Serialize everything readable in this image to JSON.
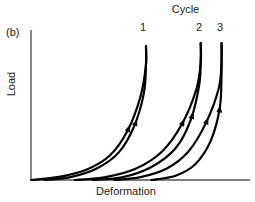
{
  "figure": {
    "panel_label": "(b)",
    "legend_title": "Cycle",
    "cycle_labels": [
      "1",
      "2",
      "3"
    ],
    "ink_color": "#000000",
    "axis_color": "#555555"
  },
  "chart_data": {
    "type": "line",
    "title": "Cycle",
    "subtitle": "(b)",
    "xlabel": "Deformation",
    "ylabel": "Load",
    "grid": false,
    "legend_position": "top",
    "axis_ticks": false,
    "xlim": [
      0,
      1
    ],
    "ylim": [
      0,
      1
    ],
    "annotations": [
      {
        "text": "(b)",
        "x": 0.02,
        "y": 1.02
      },
      {
        "text": "Cycle",
        "x": 0.7,
        "y": 1.12
      },
      {
        "text": "1",
        "x": 0.525,
        "y": 1.03
      },
      {
        "text": "2",
        "x": 0.775,
        "y": 1.03
      },
      {
        "text": "3",
        "x": 0.87,
        "y": 1.03
      }
    ],
    "series": [
      {
        "name": "Cycle 1 loading",
        "arrow_direction": "up",
        "points": [
          [
            0.0,
            0.0
          ],
          [
            0.12,
            0.02
          ],
          [
            0.25,
            0.07
          ],
          [
            0.36,
            0.17
          ],
          [
            0.44,
            0.34
          ],
          [
            0.5,
            0.58
          ],
          [
            0.525,
            0.8
          ],
          [
            0.525,
            0.93
          ]
        ]
      },
      {
        "name": "Cycle 1 unloading",
        "arrow_direction": "up",
        "points": [
          [
            0.06,
            0.0
          ],
          [
            0.18,
            0.02
          ],
          [
            0.3,
            0.08
          ],
          [
            0.4,
            0.19
          ],
          [
            0.47,
            0.37
          ],
          [
            0.515,
            0.6
          ],
          [
            0.525,
            0.8
          ],
          [
            0.525,
            0.93
          ]
        ]
      },
      {
        "name": "Cycle 2 loading",
        "arrow_direction": "up",
        "points": [
          [
            0.2,
            0.0
          ],
          [
            0.34,
            0.02
          ],
          [
            0.48,
            0.08
          ],
          [
            0.6,
            0.2
          ],
          [
            0.69,
            0.39
          ],
          [
            0.755,
            0.63
          ],
          [
            0.775,
            0.82
          ],
          [
            0.775,
            0.95
          ]
        ]
      },
      {
        "name": "Cycle 2 unloading",
        "arrow_direction": "up",
        "points": [
          [
            0.28,
            0.0
          ],
          [
            0.42,
            0.02
          ],
          [
            0.55,
            0.09
          ],
          [
            0.66,
            0.22
          ],
          [
            0.73,
            0.42
          ],
          [
            0.768,
            0.66
          ],
          [
            0.775,
            0.83
          ],
          [
            0.775,
            0.95
          ]
        ]
      },
      {
        "name": "Cycle 3 loading",
        "arrow_direction": "up",
        "points": [
          [
            0.38,
            0.0
          ],
          [
            0.5,
            0.02
          ],
          [
            0.62,
            0.08
          ],
          [
            0.72,
            0.2
          ],
          [
            0.8,
            0.4
          ],
          [
            0.858,
            0.64
          ],
          [
            0.87,
            0.83
          ],
          [
            0.87,
            0.95
          ]
        ]
      },
      {
        "name": "Cycle 3 unloading",
        "arrow_direction": "up",
        "points": [
          [
            0.55,
            0.0
          ],
          [
            0.66,
            0.03
          ],
          [
            0.75,
            0.11
          ],
          [
            0.82,
            0.27
          ],
          [
            0.862,
            0.5
          ],
          [
            0.87,
            0.74
          ],
          [
            0.87,
            0.95
          ]
        ]
      }
    ],
    "arrow_markers": [
      {
        "series": "Cycle 1 loading",
        "x": 0.455,
        "y": 0.38
      },
      {
        "series": "Cycle 1 unloading",
        "x": 0.495,
        "y": 0.42
      },
      {
        "series": "Cycle 2 loading",
        "x": 0.705,
        "y": 0.42
      },
      {
        "series": "Cycle 2 unloading",
        "x": 0.748,
        "y": 0.47
      },
      {
        "series": "Cycle 3 loading",
        "x": 0.815,
        "y": 0.43
      },
      {
        "series": "Cycle 3 unloading",
        "x": 0.855,
        "y": 0.52
      }
    ]
  }
}
